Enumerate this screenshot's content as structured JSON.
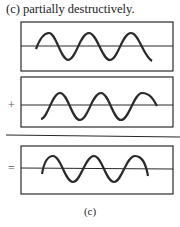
{
  "heading": "(c) partially destructively.",
  "caption": "(c)",
  "operators": {
    "plus": "+",
    "equals": "="
  },
  "colors": {
    "ink": "#2a2a2a",
    "background": "#ffffff"
  },
  "panels": [
    {
      "name": "wave-1",
      "box": [
        21,
        22,
        173,
        71
      ]
    },
    {
      "name": "wave-2",
      "box": [
        21,
        77,
        173,
        127
      ]
    },
    {
      "name": "sum-wave",
      "box": [
        21,
        146,
        173,
        194
      ]
    }
  ]
}
